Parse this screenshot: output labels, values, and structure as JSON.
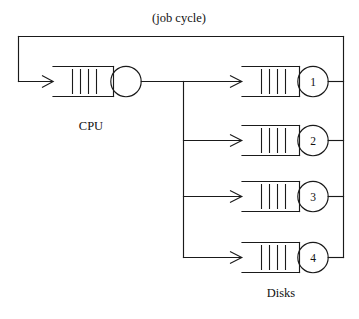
{
  "diagram": {
    "title": "(job cycle)",
    "type": "queueing-network",
    "nodes": {
      "cpu": {
        "label": "CPU",
        "queue_slots": 4,
        "server_shape": "circle",
        "server_label": ""
      },
      "disks_group_label": "Disks",
      "disks": [
        {
          "id": "1",
          "label": "1",
          "queue_slots": 4
        },
        {
          "id": "2",
          "label": "2",
          "queue_slots": 4
        },
        {
          "id": "3",
          "label": "3",
          "queue_slots": 4
        },
        {
          "id": "4",
          "label": "4",
          "queue_slots": 4
        }
      ]
    },
    "colors": {
      "stroke": "#1a1a1a",
      "background": "#ffffff",
      "text": "#111111"
    },
    "flows": [
      {
        "from": "feedback-loop",
        "to": "cpu-queue",
        "arrow": true
      },
      {
        "from": "cpu-server",
        "to": "branch-point",
        "arrow": false
      },
      {
        "from": "branch-point",
        "to": "disk-1",
        "arrow": true
      },
      {
        "from": "branch-point",
        "to": "disk-2",
        "arrow": true
      },
      {
        "from": "branch-point",
        "to": "disk-3",
        "arrow": true
      },
      {
        "from": "branch-point",
        "to": "disk-4",
        "arrow": true
      },
      {
        "from": "disk-1",
        "to": "return-bus",
        "arrow": false
      },
      {
        "from": "disk-2",
        "to": "return-bus",
        "arrow": false
      },
      {
        "from": "disk-3",
        "to": "return-bus",
        "arrow": false
      },
      {
        "from": "disk-4",
        "to": "return-bus",
        "arrow": false
      },
      {
        "from": "return-bus",
        "to": "feedback-loop",
        "arrow": false
      }
    ]
  }
}
